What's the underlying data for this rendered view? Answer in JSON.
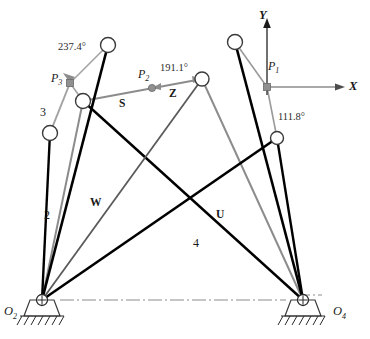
{
  "figure": {
    "type": "kinematic-linkage-diagram",
    "colors": {
      "link_black": "#000000",
      "vector_gray": "#8c8c8c",
      "dark_gray": "#4d4d4d",
      "axis_gray": "#8c8c8c",
      "text": "#1a1a1a",
      "background": "#ffffff"
    }
  },
  "angles": {
    "a237": "237.4°",
    "a191": "191.1°",
    "a111": "111.8°"
  },
  "precision_points": {
    "p1": "P",
    "p1_sub": "1",
    "p2": "P",
    "p2_sub": "2",
    "p3": "P",
    "p3_sub": "3"
  },
  "vectors": {
    "s": "S",
    "z": "Z",
    "w": "W",
    "u": "U"
  },
  "links": {
    "two": "2",
    "three": "3",
    "four": "4"
  },
  "axes": {
    "x": "X",
    "y": "Y"
  },
  "ground_pivots": {
    "o2": "O",
    "o2_sub": "2",
    "o4": "O",
    "o4_sub": "4"
  },
  "geometry": {
    "o2": [
      42,
      300
    ],
    "o4": [
      303,
      300
    ],
    "joint_top_left": [
      108,
      45
    ],
    "joint_below_p3": [
      83,
      101
    ],
    "joint_link3": [
      50,
      133
    ],
    "joint_right_mid": [
      202,
      79
    ],
    "joint_top_right": [
      235,
      42
    ],
    "joint_lower_right": [
      277,
      138
    ],
    "p1_marker": [
      267,
      87
    ],
    "p2_marker": [
      152,
      88
    ],
    "p3_marker": [
      70,
      83
    ]
  }
}
